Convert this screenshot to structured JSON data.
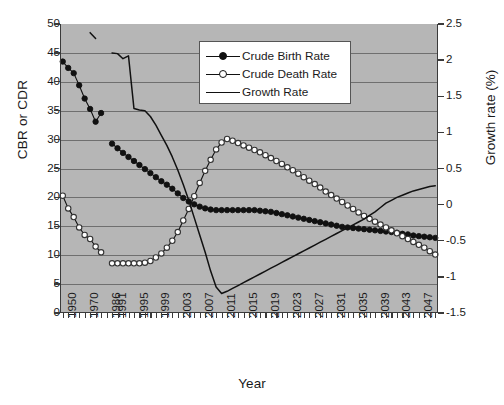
{
  "chart_data": {
    "type": "line",
    "title": "",
    "xlabel": "Year",
    "ylabel": "CBR or CDR",
    "y2label": "Growth rate (%)",
    "ylim": [
      0,
      50
    ],
    "y2lim": [
      -1.5,
      2.5
    ],
    "grid": true,
    "legend_position": "top-center",
    "yticks": [
      "0",
      "5",
      "10",
      "15",
      "20",
      "25",
      "30",
      "35",
      "40",
      "45",
      "50"
    ],
    "y2ticks": [
      "-1.5",
      "-1",
      "-0.5",
      "0",
      "0.5",
      "1",
      "1.5",
      "2",
      "2.5"
    ],
    "xticklabels": [
      "1950",
      "1970",
      "1986",
      "1991",
      "1995",
      "1999",
      "2003",
      "2007",
      "2011",
      "2015",
      "2019",
      "2023",
      "2027",
      "2031",
      "2035",
      "2039",
      "2043",
      "2047"
    ],
    "x": [
      1950,
      1955,
      1960,
      1965,
      1970,
      1975,
      1980,
      1983,
      1986,
      1991,
      1992,
      1993,
      1994,
      1995,
      1996,
      1997,
      1998,
      1999,
      2000,
      2001,
      2002,
      2003,
      2004,
      2005,
      2006,
      2007,
      2008,
      2009,
      2010,
      2011,
      2012,
      2013,
      2014,
      2015,
      2016,
      2017,
      2018,
      2019,
      2020,
      2021,
      2022,
      2023,
      2024,
      2025,
      2026,
      2027,
      2028,
      2029,
      2030,
      2031,
      2032,
      2033,
      2034,
      2035,
      2036,
      2037,
      2038,
      2039,
      2040,
      2041,
      2042,
      2043,
      2044,
      2045,
      2046,
      2047,
      2048,
      2049,
      2050
    ],
    "series": [
      {
        "name": "Crude Birth Rate",
        "axis": "left",
        "marker": "filled-circle",
        "values": [
          43.5,
          42.4,
          41.5,
          39.4,
          37.1,
          35.3,
          33.1,
          34.6,
          null,
          29.3,
          28.5,
          27.7,
          27.0,
          26.3,
          25.6,
          24.9,
          24.2,
          23.5,
          22.8,
          22.2,
          21.5,
          20.7,
          19.9,
          19.3,
          18.8,
          18.4,
          18.1,
          17.9,
          17.8,
          17.8,
          17.8,
          17.8,
          17.8,
          17.8,
          17.8,
          17.8,
          17.7,
          17.6,
          17.5,
          17.3,
          17.1,
          16.9,
          16.7,
          16.5,
          16.3,
          16.1,
          15.9,
          15.7,
          15.5,
          15.3,
          15.1,
          14.9,
          14.8,
          14.7,
          14.6,
          14.5,
          14.4,
          14.3,
          14.2,
          14.1,
          14.0,
          13.9,
          13.7,
          13.6,
          13.4,
          13.3,
          13.2,
          13.1,
          13.0
        ]
      },
      {
        "name": "Crude Death Rate",
        "axis": "left",
        "marker": "open-circle",
        "values": [
          20.3,
          18.1,
          16.6,
          14.8,
          13.5,
          12.8,
          11.5,
          10.5,
          null,
          8.6,
          8.6,
          8.6,
          8.6,
          8.6,
          8.6,
          8.7,
          9.0,
          9.6,
          10.3,
          11.3,
          12.5,
          14.0,
          16.0,
          18.0,
          20.2,
          22.5,
          24.6,
          26.5,
          28.3,
          29.5,
          30.1,
          29.8,
          29.4,
          29.0,
          28.6,
          28.2,
          27.8,
          27.3,
          26.8,
          26.3,
          25.8,
          25.2,
          24.7,
          24.1,
          23.5,
          22.9,
          22.3,
          21.7,
          21.0,
          20.4,
          19.8,
          19.2,
          18.6,
          18.0,
          17.4,
          16.8,
          16.3,
          15.8,
          15.3,
          14.8,
          14.3,
          13.8,
          13.3,
          12.8,
          12.3,
          11.8,
          11.3,
          10.7,
          10.1
        ]
      },
      {
        "name": "Growth Rate",
        "axis": "right",
        "marker": "none",
        "values": [
          null,
          null,
          null,
          null,
          null,
          2.38,
          2.3,
          null,
          null,
          2.1,
          2.09,
          2.02,
          2.06,
          1.33,
          1.31,
          1.3,
          1.22,
          1.1,
          0.96,
          0.82,
          0.66,
          0.48,
          0.28,
          0.06,
          -0.18,
          -0.42,
          -0.66,
          -0.92,
          -1.14,
          -1.23,
          -1.2,
          -1.16,
          -1.12,
          -1.08,
          -1.04,
          -1.0,
          -0.96,
          -0.92,
          -0.88,
          -0.84,
          -0.8,
          -0.76,
          -0.72,
          -0.68,
          -0.64,
          -0.6,
          -0.56,
          -0.52,
          -0.48,
          -0.44,
          -0.4,
          -0.36,
          -0.32,
          -0.28,
          -0.24,
          -0.2,
          -0.15,
          -0.1,
          -0.04,
          0.02,
          0.06,
          0.1,
          0.13,
          0.16,
          0.19,
          0.21,
          0.23,
          0.25,
          0.26
        ]
      }
    ]
  },
  "legend": {
    "items": [
      {
        "label": "Crude Birth Rate",
        "marker": "filled-circle"
      },
      {
        "label": "Crude Death Rate",
        "marker": "open-circle"
      },
      {
        "label": "Growth Rate",
        "marker": "line"
      }
    ]
  },
  "colors": {
    "plot_background": "#b6b6b6",
    "gridline": "#6f6f6f",
    "axis": "#3a3a3a",
    "series_line": "#111111",
    "legend_background": "#ffffff"
  }
}
